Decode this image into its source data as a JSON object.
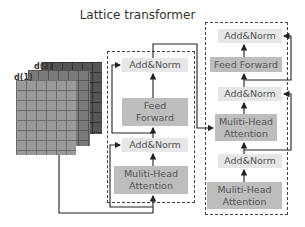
{
  "title": "Lattice transformer",
  "lattice": {
    "labels": [
      "d(1)",
      "d(2)"
    ],
    "colors": [
      "#9a9a9a",
      "#7a7a7a",
      "#555555"
    ]
  },
  "encoder": {
    "blocks": [
      "Add&Norm",
      "Feed Forward",
      "Add&Norm",
      "Muliti-Head Attention"
    ]
  },
  "decoder": {
    "blocks": [
      "Add&Norm",
      "Feed Forward",
      "Add&Norm",
      "Muliti-Head Attention",
      "Add&Norm",
      "Muliti-Head Attention"
    ]
  },
  "colors": {
    "light_block": "#e6e6e6",
    "dark_block": "#bdbdbd",
    "line": "#222222"
  }
}
